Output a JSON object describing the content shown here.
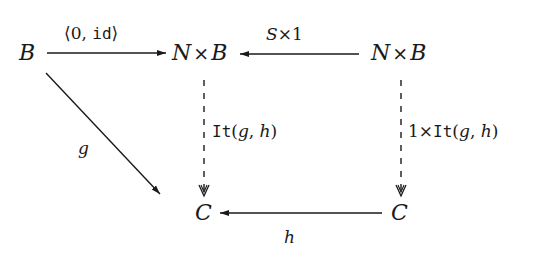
{
  "diagram": {
    "type": "commutative-diagram",
    "nodes": {
      "B": {
        "label": "B"
      },
      "NxB_center": {
        "left": "N",
        "op": "×",
        "right": "B"
      },
      "NxB_right": {
        "left": "N",
        "op": "×",
        "right": "B"
      },
      "C_left": {
        "label": "C"
      },
      "C_right": {
        "label": "C"
      }
    },
    "arrows": {
      "B_to_NxB": {
        "from": "B",
        "to": "N×B",
        "label_open": "⟨",
        "label_0": "0, ",
        "label_tt": "id",
        "label_close": "⟩",
        "style": "solid"
      },
      "NxB_right_to_NxB_center": {
        "from": "N×B",
        "to": "N×B",
        "label_a": "S",
        "label_op": "×",
        "label_b": "1",
        "style": "solid"
      },
      "B_to_C": {
        "from": "B",
        "to": "C",
        "label": "g",
        "style": "solid"
      },
      "NxB_center_to_C": {
        "from": "N×B",
        "to": "C",
        "label_tt": "It",
        "label_args_open": "(",
        "label_g": "g",
        "label_comma": ", ",
        "label_h": "h",
        "label_args_close": ")",
        "style": "dashed"
      },
      "NxB_right_to_C_right": {
        "from": "N×B",
        "to": "C",
        "label_prefix": "1",
        "label_op": "×",
        "label_tt": "It",
        "label_args_open": "(",
        "label_g": "g",
        "label_comma": ", ",
        "label_h": "h",
        "label_args_close": ")",
        "style": "dashed"
      },
      "C_right_to_C_left": {
        "from": "C",
        "to": "C",
        "label": "h",
        "style": "solid"
      }
    },
    "colors": {
      "ink": "#1a1a1a",
      "background": "#ffffff"
    }
  }
}
